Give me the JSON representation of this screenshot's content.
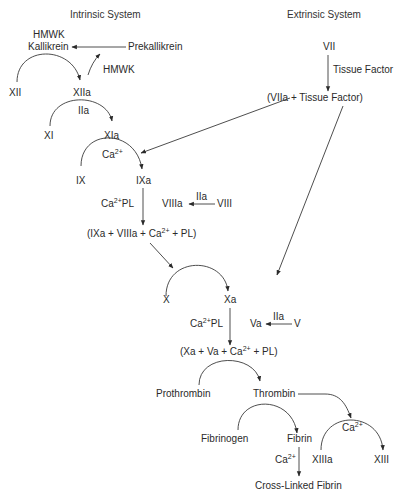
{
  "headers": {
    "intrinsic": "Intrinsic System",
    "extrinsic": "Extrinsic System"
  },
  "intrinsic": {
    "hmwk_top": "HMWK",
    "kallikrein": "Kallikrein",
    "prekallikrein": "Prekallikrein",
    "hmwk": "HMWK",
    "xii": "XII",
    "xiia": "XIIa",
    "iia_1": "IIa",
    "xi": "XI",
    "xia": "XIa",
    "ca_1": "Ca",
    "ix": "IX",
    "ixa": "IXa",
    "ca_pl_1": "Ca",
    "ca_pl_1_tail": "PL",
    "viiia": "VIIIa",
    "iia_2": "IIa",
    "viii": "VIII",
    "tenase": [
      "(IXa + VIIIa + Ca",
      " + PL)"
    ]
  },
  "extrinsic": {
    "vii": "VII",
    "tissue_factor": "Tissue Factor",
    "complex": "(VIIa + Tissue Factor)"
  },
  "common": {
    "x": "X",
    "xa": "Xa",
    "ca_pl_2": "Ca",
    "ca_pl_2_tail": "PL",
    "va": "Va",
    "iia_3": "IIa",
    "v": "V",
    "prothrombinase": [
      "(Xa + Va + Ca",
      " + PL)"
    ],
    "prothrombin": "Prothrombin",
    "thrombin": "Thrombin",
    "fibrinogen": "Fibrinogen",
    "fibrin": "Fibrin",
    "ca_3": "Ca",
    "xiiia": "XIIIa",
    "ca_4": "Ca",
    "xiii": "XIII",
    "cross_linked": "Cross-Linked Fibrin"
  },
  "superscript": "2+"
}
